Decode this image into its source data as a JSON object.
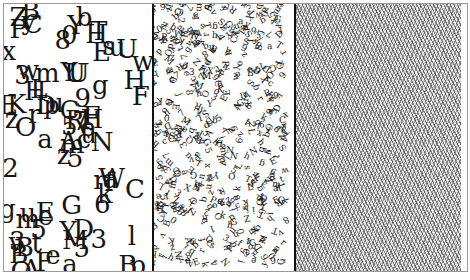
{
  "figure": {
    "colors": {
      "ink": "#151515",
      "background": "#ffffff",
      "border": "#9a9a9a",
      "divider": "#111111"
    },
    "panels": [
      {
        "name": "large-letters",
        "glyphs": [
          "5",
          "3",
          "m",
          "3",
          "H",
          "e",
          "T",
          "U",
          "E",
          "c",
          "C",
          "p",
          "O",
          "w",
          "z",
          "g",
          "A",
          "Y",
          "9",
          "u",
          "u",
          "B",
          "t",
          "U",
          "F",
          "f",
          "w",
          "0",
          "z",
          "r",
          "F",
          "A",
          "Y",
          "5",
          "m",
          "s",
          "E",
          "B",
          "l",
          "a",
          "b",
          "p",
          "r",
          "6",
          "F",
          "E",
          "e",
          "O",
          "M",
          "u",
          "m",
          "H",
          "x",
          "k",
          "3",
          "5",
          "y",
          "Z",
          "D",
          "U",
          "Y",
          "a",
          "K",
          "L",
          "u",
          "B",
          "H",
          "8",
          "R",
          "g",
          "G",
          "e",
          "W",
          "D",
          "v",
          "P",
          "H",
          "2",
          "C",
          "5",
          "7",
          "B",
          "N",
          "C",
          "a"
        ]
      },
      {
        "name": "small-letters",
        "glyphs": [
          "a",
          "y",
          "N",
          "k",
          "S",
          "b",
          "5",
          "X",
          "4",
          "D",
          "x",
          "h",
          "d",
          "o",
          "9",
          "q",
          "2",
          "G",
          "c",
          "K",
          "e",
          "3",
          "P",
          "M",
          "z",
          "8",
          "L",
          "u",
          "r",
          "T",
          "f",
          "6",
          "B",
          "j",
          "n",
          "s",
          "w",
          "Y",
          "Q",
          "A",
          "R",
          "E",
          "1",
          "v",
          "0",
          "h",
          "g",
          "7",
          "C",
          "m",
          "O",
          "p",
          "i",
          "t",
          "Z"
        ]
      },
      {
        "name": "noise-texture",
        "glyphs": []
      }
    ]
  }
}
